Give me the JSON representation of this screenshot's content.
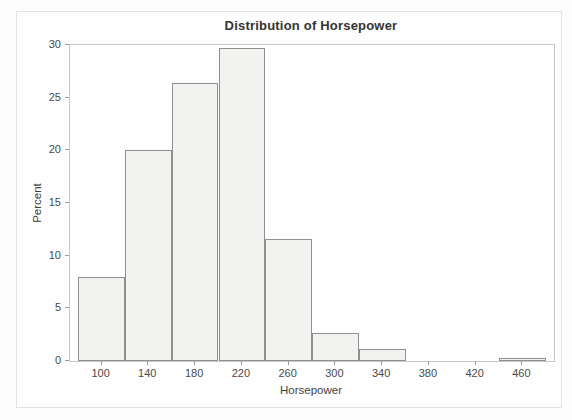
{
  "colors": {
    "bar_fill": "#f2f2f0",
    "bar_border": "#8f8f8f",
    "frame_border": "#c9c9c9",
    "tick_color": "#9a9a9a",
    "title_text": "#343434",
    "label_text": "#424242"
  },
  "chart_data": {
    "type": "bar",
    "subtype": "histogram",
    "title": "Distribution of Horsepower",
    "xlabel": "Horsepower",
    "ylabel": "Percent",
    "bin_width": 40,
    "categories": [
      100,
      140,
      180,
      220,
      260,
      300,
      340,
      380,
      420,
      460
    ],
    "values": [
      8.0,
      20.0,
      26.4,
      29.7,
      11.6,
      2.7,
      1.1,
      0,
      0,
      0.3
    ],
    "x_ticks": [
      100,
      140,
      180,
      220,
      260,
      300,
      340,
      380,
      420,
      460
    ],
    "y_ticks": [
      0,
      5,
      10,
      15,
      20,
      25,
      30
    ],
    "xlim": [
      73,
      487
    ],
    "ylim": [
      0,
      30
    ],
    "grid": false,
    "legend": false
  }
}
